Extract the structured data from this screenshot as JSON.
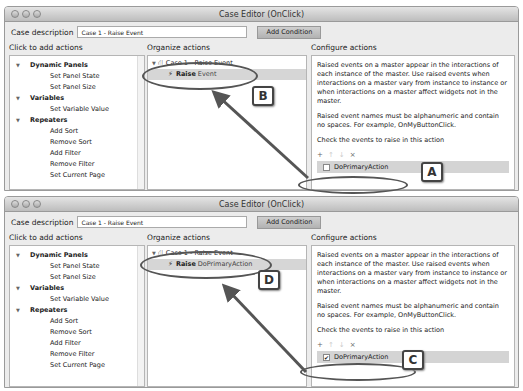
{
  "windows": [
    {
      "title": "Case Editor (OnClick)",
      "case_description_label": "Case description",
      "case_description_value": "Case 1 - Raise Event",
      "add_condition_label": "Add Condition",
      "left": {
        "label": "Click to add actions",
        "groups": [
          {
            "name": "Dynamic Panels",
            "items": [
              "Set Panel State",
              "Set Panel Size"
            ]
          },
          {
            "name": "Variables",
            "items": [
              "Set Variable Value"
            ]
          },
          {
            "name": "Repeaters",
            "items": [
              "Add Sort",
              "Remove Sort",
              "Add Filter",
              "Remove Filter",
              "Set Current Page"
            ]
          }
        ]
      },
      "middle": {
        "label": "Organize actions",
        "case_label": "Case 1 - Raise Event",
        "action_verb": "Raise",
        "action_target": "Event"
      },
      "right": {
        "label": "Configure actions",
        "para1": "Raised events on a master appear in the interactions of each instance of the master. Use raised events when interactions on a master vary from instance to instance or when interactions on a master affect widgets not in the master.",
        "para2": "Raised event names must be alphanumeric and contain no spaces. For example, OnMyButtonClick.",
        "para3": "Check the events to raise in this action",
        "toolbar": [
          "+",
          "↑",
          "↓",
          "×"
        ],
        "event_name": "DoPrimaryAction",
        "event_checked": false
      },
      "callouts": [
        "A",
        "B"
      ]
    },
    {
      "title": "Case Editor (OnClick)",
      "case_description_label": "Case description",
      "case_description_value": "Case 1 - Raise Event",
      "add_condition_label": "Add Condition",
      "left": {
        "label": "Click to add actions",
        "groups": [
          {
            "name": "Dynamic Panels",
            "items": [
              "Set Panel State",
              "Set Panel Size"
            ]
          },
          {
            "name": "Variables",
            "items": [
              "Set Variable Value"
            ]
          },
          {
            "name": "Repeaters",
            "items": [
              "Add Sort",
              "Remove Sort",
              "Add Filter",
              "Remove Filter",
              "Set Current Page"
            ]
          }
        ]
      },
      "middle": {
        "label": "Organize actions",
        "case_label": "Case 1 - Raise Event",
        "action_verb": "Raise",
        "action_target": "DoPrimaryAction"
      },
      "right": {
        "label": "Configure actions",
        "para1": "Raised events on a master appear in the interactions of each instance of the master. Use raised events when interactions on a master vary from instance to instance or when interactions on a master affect widgets not in the master.",
        "para2": "Raised event names must be alphanumeric and contain no spaces. For example, OnMyButtonClick.",
        "para3": "Check the events to raise in this action",
        "toolbar": [
          "+",
          "↑",
          "↓",
          "×"
        ],
        "event_name": "DoPrimaryAction",
        "event_checked": true
      },
      "callouts": [
        "C",
        "D"
      ]
    }
  ],
  "icons": {
    "tree_expanded": "▼",
    "case_icon": "⛙",
    "bolt": "⚡",
    "check": "✔"
  }
}
